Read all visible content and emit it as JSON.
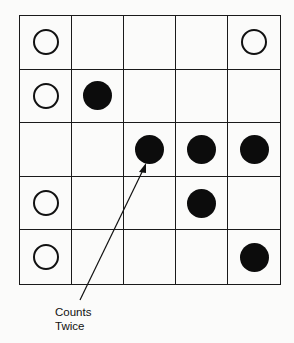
{
  "diagram": {
    "rows": 5,
    "cols": 5,
    "grid": [
      [
        "open",
        "",
        "",
        "",
        "open"
      ],
      [
        "open",
        "filled",
        "",
        "",
        ""
      ],
      [
        "",
        "",
        "filled",
        "filled",
        "filled"
      ],
      [
        "open",
        "",
        "",
        "filled",
        ""
      ],
      [
        "open",
        "",
        "",
        "",
        "filled"
      ]
    ],
    "annotation": {
      "line1": "Counts",
      "line2": "Twice",
      "points_to": {
        "row": 2,
        "col": 2
      }
    }
  }
}
